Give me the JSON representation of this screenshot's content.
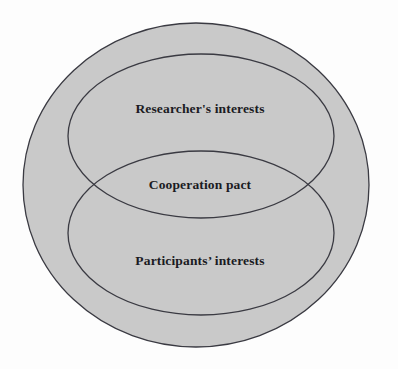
{
  "diagram": {
    "type": "venn",
    "title": "",
    "background_color": "#fdfdfd",
    "fill_color": "#c9c9c9",
    "outline_color": "#3a3a42",
    "label_color": "#1b1b23",
    "universe": {
      "name": "outer-boundary-circle",
      "label": "",
      "cx": 196,
      "cy": 185,
      "rx": 173,
      "ry": 162
    },
    "sets": [
      {
        "id": "researchers",
        "label": "Researcher's interests",
        "label_x": 200,
        "label_y": 110,
        "cx": 201,
        "cy": 136,
        "rx": 133,
        "ry": 82
      },
      {
        "id": "participants",
        "label": "Participants’ interests",
        "label_x": 200,
        "label_y": 262,
        "cx": 201,
        "cy": 233,
        "rx": 133,
        "ry": 82
      }
    ],
    "intersection": {
      "id": "cooperation",
      "label": "Cooperation pact",
      "label_x": 200,
      "label_y": 186,
      "between": [
        "researchers",
        "participants"
      ]
    }
  }
}
